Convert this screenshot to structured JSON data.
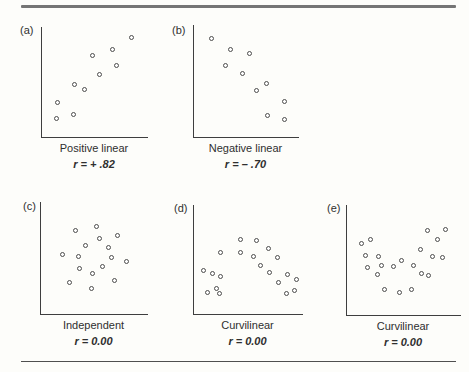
{
  "figure": {
    "background": "#fdfdfa",
    "axis_color": "#3e3e3e",
    "dot_stroke_color": "#4d4d4d",
    "top_rule_color": "#757575",
    "bottom_rule_color": "#4f4f4f",
    "text_color": "#2f2f2f"
  },
  "chart_data": [
    {
      "id": "a",
      "type": "scatter",
      "panel_label": "(a)",
      "title": "Positive linear",
      "r_label": "r = + .82",
      "r_value": 0.82,
      "axes": "unlabeled, no ticks",
      "coords": "percent of plot area, origin bottom-left, x right, y up",
      "points": [
        [
          84.2,
          90.8
        ],
        [
          66.1,
          79.4
        ],
        [
          48.1,
          73.9
        ],
        [
          69.9,
          65.4
        ],
        [
          53.8,
          57.2
        ],
        [
          31.0,
          47.3
        ],
        [
          39.9,
          43.1
        ],
        [
          14.2,
          31.2
        ],
        [
          29.8,
          20.5
        ],
        [
          13.9,
          16.8
        ]
      ]
    },
    {
      "id": "b",
      "type": "scatter",
      "panel_label": "(b)",
      "title": "Negative linear",
      "r_label": "r = – .70",
      "r_value": -0.7,
      "axes": "unlabeled, no ticks",
      "coords": "percent of plot area, origin bottom-left, x right, y up",
      "points": [
        [
          16.4,
          88.3
        ],
        [
          34.4,
          77.8
        ],
        [
          52.7,
          74.6
        ],
        [
          29.9,
          63.4
        ],
        [
          46.0,
          57.1
        ],
        [
          68.8,
          47.6
        ],
        [
          59.9,
          41.9
        ],
        [
          86.2,
          31.4
        ],
        [
          69.7,
          19.4
        ],
        [
          86.2,
          15.8
        ]
      ]
    },
    {
      "id": "c",
      "type": "scatter",
      "panel_label": "(c)",
      "title": "Independent",
      "r_label": "r = 0.00",
      "r_value": 0.0,
      "axes": "unlabeled, no ticks",
      "coords": "percent of plot area, origin bottom-left, x right, y up",
      "points": [
        [
          51.5,
          78.5
        ],
        [
          31.9,
          74.7
        ],
        [
          71.9,
          70.2
        ],
        [
          55.0,
          67.1
        ],
        [
          41.5,
          61.5
        ],
        [
          63.1,
          59.7
        ],
        [
          19.7,
          53.4
        ],
        [
          35.0,
          51.4
        ],
        [
          65.9,
          50.1
        ],
        [
          79.7,
          46.9
        ],
        [
          57.2,
          42.7
        ],
        [
          36.3,
          40.9
        ],
        [
          47.8,
          36.2
        ],
        [
          69.1,
          29.5
        ],
        [
          26.9,
          28.4
        ],
        [
          46.9,
          22.7
        ]
      ]
    },
    {
      "id": "d",
      "type": "scatter",
      "panel_label": "(d)",
      "title": "Curvilinear",
      "r_label": "r = 0.00",
      "r_value": 0.0,
      "axes": "unlabeled, no ticks",
      "coords": "percent of plot area, origin bottom-left, x right, y up",
      "points": [
        [
          42.4,
          68.4
        ],
        [
          57.2,
          67.5
        ],
        [
          68.0,
          60.2
        ],
        [
          24.4,
          56.8
        ],
        [
          43.1,
          56.1
        ],
        [
          54.8,
          53.1
        ],
        [
          76.6,
          52.2
        ],
        [
          60.6,
          44.5
        ],
        [
          8.3,
          40.2
        ],
        [
          69.6,
          37.7
        ],
        [
          16.6,
          37.2
        ],
        [
          85.5,
          36.2
        ],
        [
          24.6,
          34.0
        ],
        [
          93.8,
          31.6
        ],
        [
          77.9,
          28.5
        ],
        [
          20.7,
          23.0
        ],
        [
          92.6,
          21.5
        ],
        [
          12.4,
          20.0
        ],
        [
          23.1,
          19.0
        ],
        [
          85.2,
          19.0
        ]
      ]
    },
    {
      "id": "e",
      "type": "scatter",
      "panel_label": "(e)",
      "title": "Curvilinear",
      "r_label": "r = 0.00",
      "r_value": 0.0,
      "axes": "unlabeled, no ticks",
      "coords": "percent of plot area, origin bottom-left, x right, y up",
      "points": [
        [
          86.8,
          78.0
        ],
        [
          70.8,
          76.4
        ],
        [
          20.4,
          68.9
        ],
        [
          79.6,
          68.9
        ],
        [
          12.3,
          65.3
        ],
        [
          64.9,
          59.8
        ],
        [
          15.8,
          53.8
        ],
        [
          75.4,
          53.1
        ],
        [
          27.8,
          52.9
        ],
        [
          84.2,
          52.2
        ],
        [
          48.2,
          49.2
        ],
        [
          30.4,
          45.3
        ],
        [
          57.9,
          45.3
        ],
        [
          40.4,
          44.1
        ],
        [
          18.2,
          43.2
        ],
        [
          65.5,
          38.1
        ],
        [
          26.9,
          36.6
        ],
        [
          71.1,
          36.3
        ],
        [
          32.7,
          23.6
        ],
        [
          57.0,
          23.1
        ],
        [
          45.9,
          20.5
        ]
      ]
    }
  ]
}
